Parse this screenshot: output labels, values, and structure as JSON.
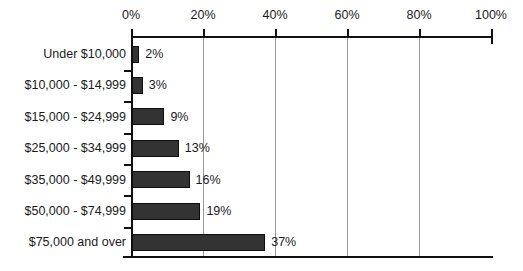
{
  "chart_data": {
    "type": "bar",
    "orientation": "horizontal",
    "title": "",
    "subtitle": "",
    "xlabel": "",
    "ylabel": "",
    "categories": [
      "Under $10,000",
      "$10,000 - $14,999",
      "$15,000 - $24,999",
      "$25,000 - $34,999",
      "$35,000 - $49,999",
      "$50,000 - $74,999",
      "$75,000 and over"
    ],
    "values": [
      2,
      3,
      9,
      13,
      16,
      19,
      37
    ],
    "value_labels": [
      "2%",
      "3%",
      "9%",
      "13%",
      "16%",
      "19%",
      "37%"
    ],
    "xlim": [
      0,
      100
    ],
    "xtick_values": [
      0,
      20,
      40,
      60,
      80,
      100
    ],
    "xtick_labels": [
      "0%",
      "20%",
      "40%",
      "60%",
      "80%",
      "100%"
    ],
    "grid": true,
    "grid_axis": "x",
    "legend": false,
    "legend_position": "none",
    "colors": {
      "bar_fill": "#333333",
      "bar_border": "#0d0d0d",
      "gridline": "#9a9a9a",
      "axis": "#111111",
      "text": "#1a1a1a",
      "background": "#ffffff"
    }
  }
}
